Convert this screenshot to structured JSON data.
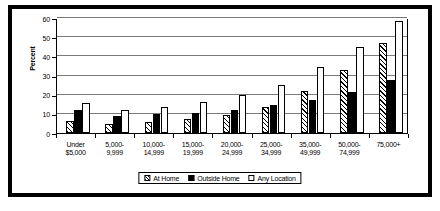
{
  "chart_data": {
    "type": "bar",
    "title": "",
    "xlabel": "",
    "ylabel": "Percent",
    "ylim": [
      0,
      60
    ],
    "yticks": [
      0,
      10,
      20,
      30,
      40,
      50,
      60
    ],
    "grid": true,
    "legend_position": "bottom-center",
    "categories": [
      "Under\n$5,000",
      "5,000-\n9,999",
      "10,000-\n14,999",
      "15,000-\n19,999",
      "20,000-\n24,999",
      "25,000-\n34,999",
      "35,000-\n49,999",
      "50,000-\n74,999",
      "75,000+"
    ],
    "series": [
      {
        "name": "At Home",
        "pattern": "diagonal-hatch",
        "color": "#ffffff",
        "values": [
          6.5,
          4.9,
          6.0,
          7.5,
          9.3,
          13.8,
          22.1,
          32.8,
          47.2
        ]
      },
      {
        "name": "Outside Home",
        "pattern": "solid",
        "color": "#000000",
        "values": [
          12.0,
          8.8,
          9.8,
          10.7,
          12.0,
          14.6,
          17.3,
          21.2,
          27.6
        ]
      },
      {
        "name": "Any Location",
        "pattern": "plain",
        "color": "#ffffff",
        "values": [
          15.9,
          11.8,
          13.6,
          16.4,
          19.6,
          25.0,
          34.2,
          45.0,
          58.6
        ]
      }
    ]
  }
}
